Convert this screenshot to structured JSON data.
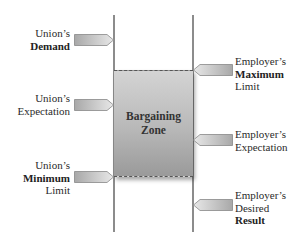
{
  "diagram": {
    "zone_label_line1": "Bargaining",
    "zone_label_line2": "Zone",
    "union": {
      "demand": {
        "line1": "Union’s",
        "line2_bold": "Demand"
      },
      "expectation": {
        "line1": "Union’s",
        "line2": "Expectation"
      },
      "minimum": {
        "line1": "Union’s",
        "line2_bold": "Minimum",
        "line3": "Limit"
      }
    },
    "employer": {
      "maximum": {
        "line1": "Employer’s",
        "line2_bold": "Maximum",
        "line3": "Limit"
      },
      "expectation": {
        "line1": "Employer’s",
        "line2": "Expectation"
      },
      "desired": {
        "line1": "Employer’s",
        "line2": "Desired",
        "line3_bold": "Result"
      }
    },
    "colors": {
      "zone_top": "#d4d4d4",
      "zone_bottom": "#9a9a9a",
      "axis_line": "#8c8c8c",
      "arrow_fill_light": "#e6e6e6",
      "arrow_fill_dark": "#a8a8a8"
    }
  }
}
